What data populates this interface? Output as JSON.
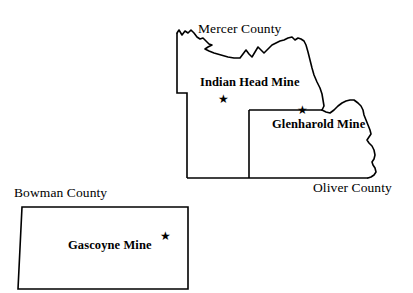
{
  "figure": {
    "background_color": "#ffffff",
    "line_color": "#000000",
    "width": 413,
    "height": 293
  },
  "counties": [
    {
      "id": "mercer",
      "label": "Mercer County",
      "label_style": "regular"
    },
    {
      "id": "oliver",
      "label": "Oliver County",
      "label_style": "regular"
    },
    {
      "id": "bowman",
      "label": "Bowman County",
      "label_style": "regular"
    }
  ],
  "mines": [
    {
      "id": "indian-head",
      "label": "Indian Head Mine",
      "county": "Mercer County",
      "marker": "star",
      "marker_glyph": "★",
      "marker_position": "below-label"
    },
    {
      "id": "glenharold",
      "label": "Glenharold Mine",
      "county": "Oliver County",
      "marker": "star",
      "marker_glyph": "★",
      "marker_position": "above-label"
    },
    {
      "id": "gascoyne",
      "label": "Gascoyne Mine",
      "county": "Bowman County",
      "marker": "star",
      "marker_glyph": "★",
      "marker_position": "upper-right-of-label"
    }
  ]
}
